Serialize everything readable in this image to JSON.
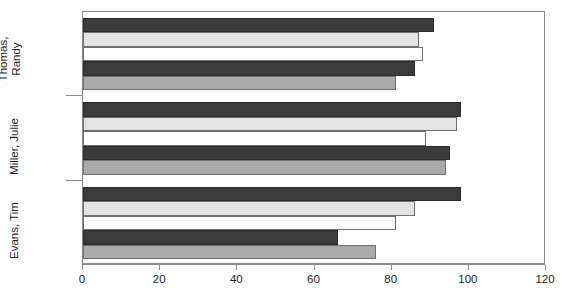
{
  "chart_data": {
    "type": "bar",
    "orientation": "horizontal",
    "title": "",
    "xlabel": "",
    "ylabel": "",
    "categories": [
      "Thomas,\nRandy",
      "Miller, Julie",
      "Evans, Tim"
    ],
    "xlim": [
      0,
      120
    ],
    "xticks": [
      0,
      20,
      40,
      60,
      80,
      100,
      120
    ],
    "xticklabels": [
      "0",
      "20",
      "40",
      "60",
      "80",
      "100",
      "120"
    ],
    "grid": false,
    "legend": "none",
    "series": [
      {
        "name": "series-1",
        "color": "#3b3b3b",
        "values": [
          91,
          98,
          98
        ]
      },
      {
        "name": "series-2",
        "color": "#e3e3e3",
        "values": [
          87,
          97,
          86
        ]
      },
      {
        "name": "series-3",
        "color": "#fdfdfd",
        "values": [
          88,
          89,
          81
        ]
      },
      {
        "name": "series-4",
        "color": "#3b3b3b",
        "values": [
          86,
          95,
          66
        ]
      },
      {
        "name": "series-5",
        "color": "#aaaaaa",
        "values": [
          81,
          94,
          76
        ]
      }
    ]
  }
}
